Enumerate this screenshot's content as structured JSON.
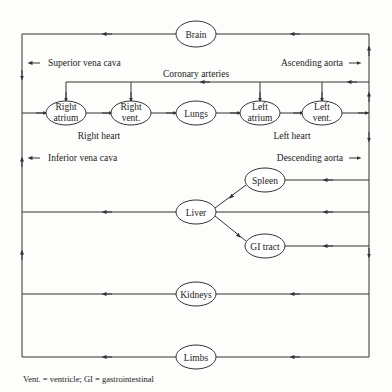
{
  "diagram": {
    "nodes": {
      "brain": {
        "label": "Brain"
      },
      "right_atrium": {
        "line1": "Right",
        "line2": "atrium"
      },
      "right_vent": {
        "line1": "Right",
        "line2": "vent."
      },
      "lungs": {
        "label": "Lungs"
      },
      "left_atrium": {
        "line1": "Left",
        "line2": "atrium"
      },
      "left_vent": {
        "line1": "Left",
        "line2": "vent."
      },
      "spleen": {
        "label": "Spleen"
      },
      "liver": {
        "label": "Liver"
      },
      "gi_tract": {
        "label": "GI tract"
      },
      "kidneys": {
        "label": "Kidneys"
      },
      "limbs": {
        "label": "Limbs"
      }
    },
    "labels": {
      "superior_vena_cava": "Superior vena cava",
      "ascending_aorta": "Ascending aorta",
      "coronary_arteries": "Coronary arteries",
      "right_heart": "Right heart",
      "left_heart": "Left heart",
      "inferior_vena_cava": "Inferior vena cava",
      "descending_aorta": "Descending aorta"
    },
    "footnote": "Vent. = ventricle; GI = gastrointestinal"
  }
}
